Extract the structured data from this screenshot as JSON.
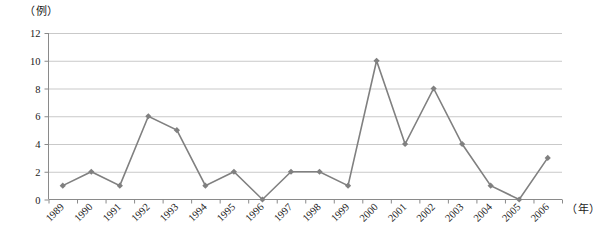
{
  "chart_data": {
    "type": "line",
    "title": "",
    "xlabel": "（年）",
    "ylabel": "（例）",
    "categories": [
      "1989",
      "1990",
      "1991",
      "1992",
      "1993",
      "1994",
      "1995",
      "1996",
      "1997",
      "1998",
      "1999",
      "2000",
      "2001",
      "2002",
      "2003",
      "2004",
      "2005",
      "2006"
    ],
    "values": [
      1,
      2,
      1,
      6,
      5,
      1,
      2,
      0,
      2,
      2,
      1,
      10,
      4,
      8,
      4,
      1,
      0,
      3
    ],
    "series": [
      {
        "name": "例数",
        "values": [
          1,
          2,
          1,
          6,
          5,
          1,
          2,
          0,
          2,
          2,
          1,
          10,
          4,
          8,
          4,
          1,
          0,
          3
        ]
      }
    ],
    "ylim": [
      0,
      12
    ],
    "yticks": [
      0,
      2,
      4,
      6,
      8,
      10,
      12
    ],
    "ytick_labels": [
      "0",
      "2",
      "4",
      "6",
      "8",
      "10",
      "12"
    ],
    "grid": true,
    "grid_axis": "y",
    "legend": false,
    "legend_position": "none",
    "marker": "diamond",
    "colors": {
      "line": "#808080",
      "marker": "#808080",
      "grid": "#c9c9c9",
      "axis": "#8a8a8a",
      "text": "#1a1a1a",
      "background": "#ffffff"
    },
    "x_tick_label_rotation": 45
  }
}
